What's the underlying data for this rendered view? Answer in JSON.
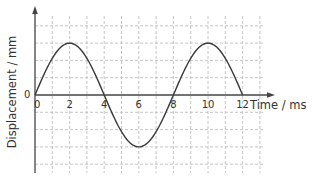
{
  "chart_data": {
    "type": "line",
    "title": "",
    "xlabel": "Time / ms",
    "ylabel": "Displacement / mm",
    "x_ticks": [
      "0",
      "2",
      "4",
      "6",
      "8",
      "10",
      "12"
    ],
    "y_tick_origin": "0",
    "xlim": [
      0,
      13
    ],
    "ylim": [
      -5,
      5
    ],
    "grid": true,
    "grid_style": "dashed",
    "legend": null,
    "series": [
      {
        "name": "displacement",
        "function": "sine",
        "amplitude_grid_units": 3,
        "period_ms": 8,
        "x": [
          0,
          1,
          2,
          3,
          4,
          5,
          6,
          7,
          8,
          9,
          10,
          11,
          12
        ],
        "y": [
          0,
          2.12,
          3,
          2.12,
          0,
          -2.12,
          -3,
          -2.12,
          0,
          2.12,
          3,
          2.12,
          0
        ]
      }
    ],
    "annotations": []
  },
  "labels": {
    "xlabel": "Time / ms",
    "ylabel": "Displacement / mm",
    "origin_y": "0",
    "origin_x": "0",
    "x_ticks": [
      "2",
      "4",
      "6",
      "8",
      "10",
      "12"
    ]
  },
  "colors": {
    "curve": "#3a3a3a",
    "axis": "#444444",
    "grid": "#b8b8b8",
    "text": "#333333"
  }
}
